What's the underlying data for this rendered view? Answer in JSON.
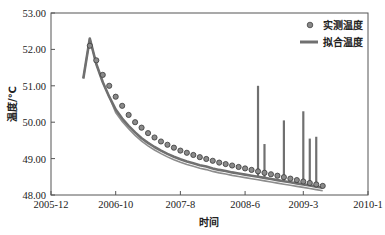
{
  "chart_data": {
    "type": "line",
    "title": "",
    "xlabel": "时间",
    "ylabel": "温度/℃",
    "x_tick_labels": [
      "2005-12",
      "2006-10",
      "2007-8",
      "2008-6",
      "2009-3",
      "2010-1"
    ],
    "y_tick_labels": [
      "48.00",
      "49.00",
      "50.00",
      "51.00",
      "52.00",
      "53.00"
    ],
    "ylim": [
      48.0,
      53.0
    ],
    "xlim": [
      "2005-12",
      "2010-1"
    ],
    "grid": false,
    "legend_position": "upper right",
    "series": [
      {
        "name": "实测温度",
        "style": "circle-markers",
        "color": "#555555",
        "x": [
          "2006-6",
          "2006-7",
          "2006-8",
          "2006-9",
          "2006-10",
          "2006-11",
          "2006-12",
          "2007-1",
          "2007-2",
          "2007-3",
          "2007-4",
          "2007-5",
          "2007-6",
          "2007-7",
          "2007-8",
          "2007-9",
          "2007-10",
          "2007-11",
          "2007-12",
          "2008-1",
          "2008-2",
          "2008-3",
          "2008-4",
          "2008-5",
          "2008-6",
          "2008-7",
          "2008-8",
          "2008-9",
          "2008-10",
          "2008-11",
          "2008-12",
          "2009-1",
          "2009-2",
          "2009-3",
          "2009-4",
          "2009-5",
          "2009-6"
        ],
        "values": [
          52.1,
          51.7,
          51.3,
          51.0,
          50.7,
          50.45,
          50.2,
          50.0,
          49.85,
          49.7,
          49.58,
          49.47,
          49.38,
          49.3,
          49.22,
          49.16,
          49.1,
          49.04,
          48.99,
          48.94,
          48.89,
          48.85,
          48.81,
          48.77,
          48.73,
          48.69,
          48.65,
          48.61,
          48.57,
          48.53,
          48.49,
          48.45,
          48.41,
          48.37,
          48.33,
          48.29,
          48.25
        ]
      },
      {
        "name": "拟合温度",
        "style": "thick-line",
        "color": "#707070",
        "x": [
          "2006-5",
          "2006-6",
          "2006-7",
          "2006-8",
          "2006-9",
          "2006-10",
          "2006-11",
          "2006-12",
          "2007-1",
          "2007-2",
          "2007-3",
          "2007-4",
          "2007-5",
          "2007-6",
          "2007-7",
          "2007-8",
          "2007-9",
          "2007-10",
          "2007-11",
          "2007-12",
          "2008-1",
          "2008-2",
          "2008-3",
          "2008-4",
          "2008-5",
          "2008-6",
          "2008-7",
          "2008-8",
          "2008-9",
          "2008-10",
          "2008-11",
          "2008-12",
          "2009-1",
          "2009-2",
          "2009-3",
          "2009-4",
          "2009-5",
          "2009-6"
        ],
        "values": [
          51.2,
          52.3,
          51.6,
          51.1,
          50.7,
          50.35,
          50.1,
          49.9,
          49.72,
          49.56,
          49.43,
          49.32,
          49.22,
          49.13,
          49.05,
          48.98,
          48.92,
          48.87,
          48.82,
          48.78,
          48.73,
          48.69,
          48.66,
          48.62,
          48.59,
          48.56,
          48.53,
          48.5,
          48.47,
          48.44,
          48.41,
          48.38,
          48.35,
          48.32,
          48.29,
          48.26,
          48.23,
          48.2
        ],
        "spikes": [
          {
            "x": "2008-8",
            "value": 51.0
          },
          {
            "x": "2008-9",
            "value": 49.4
          },
          {
            "x": "2008-12",
            "value": 50.05
          },
          {
            "x": "2009-3",
            "value": 50.3
          },
          {
            "x": "2009-4",
            "value": 49.55
          },
          {
            "x": "2009-5",
            "value": 49.6
          }
        ]
      }
    ]
  },
  "legend": {
    "measured": "实测温度",
    "fitted": "拟合温度"
  },
  "axes": {
    "xlabel": "时间",
    "ylabel": "温度/℃"
  }
}
